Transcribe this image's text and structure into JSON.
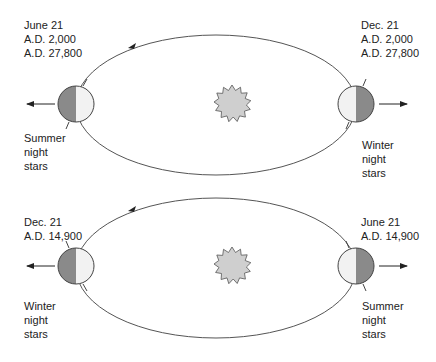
{
  "colors": {
    "orbit": "#555555",
    "earth_dark": "#8a8a8a",
    "earth_light": "#f2f2f2",
    "sun_fill": "#cfcfcf",
    "sun_stroke": "#555555"
  },
  "panels": [
    {
      "left_earth": {
        "date_lines": [
          "June 21",
          "A.D. 2,000",
          "A.D. 27,800"
        ],
        "stars_lines": [
          "Summer",
          "night",
          "stars"
        ]
      },
      "right_earth": {
        "date_lines": [
          "Dec. 21",
          "A.D. 2,000",
          "A.D. 27,800"
        ],
        "stars_lines": [
          "Winter",
          "night",
          "stars"
        ]
      }
    },
    {
      "left_earth": {
        "date_lines": [
          "Dec. 21",
          "A.D. 14,900"
        ],
        "stars_lines": [
          "Winter",
          "night",
          "stars"
        ]
      },
      "right_earth": {
        "date_lines": [
          "June 21",
          "A.D. 14,900"
        ],
        "stars_lines": [
          "Summer",
          "night",
          "stars"
        ]
      }
    }
  ]
}
